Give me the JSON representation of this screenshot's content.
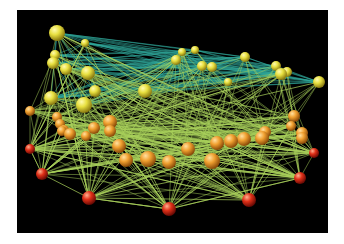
{
  "figure": {
    "background": "#000000",
    "canvas_bg": "#ffffff",
    "edge_colors": {
      "top": "#2fa89a",
      "bottom": "#a8d05a"
    },
    "node_colors": {
      "yellow": "#e8e040",
      "orange": "#f0a030",
      "red": "#e03018"
    }
  },
  "nodes": [
    {
      "x": 57,
      "y": 33,
      "r": 8,
      "c": "yellow"
    },
    {
      "x": 85,
      "y": 43,
      "r": 4,
      "c": "yellow"
    },
    {
      "x": 55,
      "y": 55,
      "r": 5,
      "c": "yellow"
    },
    {
      "x": 53,
      "y": 63,
      "r": 6,
      "c": "yellow"
    },
    {
      "x": 66,
      "y": 69,
      "r": 6,
      "c": "yellow"
    },
    {
      "x": 88,
      "y": 73,
      "r": 7,
      "c": "yellow"
    },
    {
      "x": 95,
      "y": 91,
      "r": 6,
      "c": "yellow"
    },
    {
      "x": 51,
      "y": 98,
      "r": 7,
      "c": "yellow"
    },
    {
      "x": 84,
      "y": 105,
      "r": 8,
      "c": "yellow"
    },
    {
      "x": 145,
      "y": 91,
      "r": 7,
      "c": "yellow"
    },
    {
      "x": 182,
      "y": 52,
      "r": 4,
      "c": "yellow"
    },
    {
      "x": 195,
      "y": 50,
      "r": 4,
      "c": "yellow"
    },
    {
      "x": 176,
      "y": 60,
      "r": 5,
      "c": "yellow"
    },
    {
      "x": 202,
      "y": 66,
      "r": 5,
      "c": "yellow"
    },
    {
      "x": 212,
      "y": 67,
      "r": 5,
      "c": "yellow"
    },
    {
      "x": 245,
      "y": 57,
      "r": 5,
      "c": "yellow"
    },
    {
      "x": 228,
      "y": 82,
      "r": 4,
      "c": "yellow"
    },
    {
      "x": 276,
      "y": 66,
      "r": 5,
      "c": "yellow"
    },
    {
      "x": 287,
      "y": 72,
      "r": 5,
      "c": "yellow"
    },
    {
      "x": 281,
      "y": 74,
      "r": 6,
      "c": "yellow"
    },
    {
      "x": 319,
      "y": 82,
      "r": 6,
      "c": "yellow"
    },
    {
      "x": 30,
      "y": 111,
      "r": 5,
      "c": "orange"
    },
    {
      "x": 57,
      "y": 117,
      "r": 5,
      "c": "orange"
    },
    {
      "x": 60,
      "y": 124,
      "r": 5,
      "c": "orange"
    },
    {
      "x": 64,
      "y": 130,
      "r": 5,
      "c": "orange"
    },
    {
      "x": 70,
      "y": 134,
      "r": 6,
      "c": "orange"
    },
    {
      "x": 62,
      "y": 131,
      "r": 5,
      "c": "orange"
    },
    {
      "x": 110,
      "y": 122,
      "r": 7,
      "c": "orange"
    },
    {
      "x": 94,
      "y": 128,
      "r": 6,
      "c": "orange"
    },
    {
      "x": 110,
      "y": 131,
      "r": 6,
      "c": "orange"
    },
    {
      "x": 86,
      "y": 136,
      "r": 5,
      "c": "orange"
    },
    {
      "x": 119,
      "y": 146,
      "r": 7,
      "c": "orange"
    },
    {
      "x": 126,
      "y": 160,
      "r": 7,
      "c": "orange"
    },
    {
      "x": 148,
      "y": 159,
      "r": 8,
      "c": "orange"
    },
    {
      "x": 169,
      "y": 162,
      "r": 7,
      "c": "orange"
    },
    {
      "x": 188,
      "y": 149,
      "r": 7,
      "c": "orange"
    },
    {
      "x": 212,
      "y": 161,
      "r": 8,
      "c": "orange"
    },
    {
      "x": 217,
      "y": 143,
      "r": 7,
      "c": "orange"
    },
    {
      "x": 231,
      "y": 141,
      "r": 7,
      "c": "orange"
    },
    {
      "x": 244,
      "y": 139,
      "r": 7,
      "c": "orange"
    },
    {
      "x": 262,
      "y": 138,
      "r": 7,
      "c": "orange"
    },
    {
      "x": 265,
      "y": 132,
      "r": 6,
      "c": "orange"
    },
    {
      "x": 291,
      "y": 126,
      "r": 5,
      "c": "orange"
    },
    {
      "x": 294,
      "y": 116,
      "r": 6,
      "c": "orange"
    },
    {
      "x": 302,
      "y": 133,
      "r": 6,
      "c": "orange"
    },
    {
      "x": 302,
      "y": 138,
      "r": 6,
      "c": "orange"
    },
    {
      "x": 30,
      "y": 149,
      "r": 5,
      "c": "red"
    },
    {
      "x": 42,
      "y": 174,
      "r": 6,
      "c": "red"
    },
    {
      "x": 89,
      "y": 198,
      "r": 7,
      "c": "red"
    },
    {
      "x": 169,
      "y": 209,
      "r": 7,
      "c": "red"
    },
    {
      "x": 249,
      "y": 200,
      "r": 7,
      "c": "red"
    },
    {
      "x": 300,
      "y": 178,
      "r": 6,
      "c": "red"
    },
    {
      "x": 314,
      "y": 153,
      "r": 5,
      "c": "red"
    }
  ]
}
